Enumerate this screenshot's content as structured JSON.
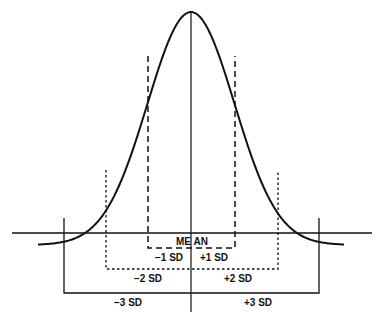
{
  "diagram": {
    "type": "normal-distribution",
    "labels": {
      "mean": "ME AN",
      "minus1": "−1 SD",
      "plus1": "+1 SD",
      "minus2": "−2 SD",
      "plus2": "+2 SD",
      "minus3": "−3 SD",
      "plus3": "+3 SD"
    },
    "line_color": "#111111"
  }
}
